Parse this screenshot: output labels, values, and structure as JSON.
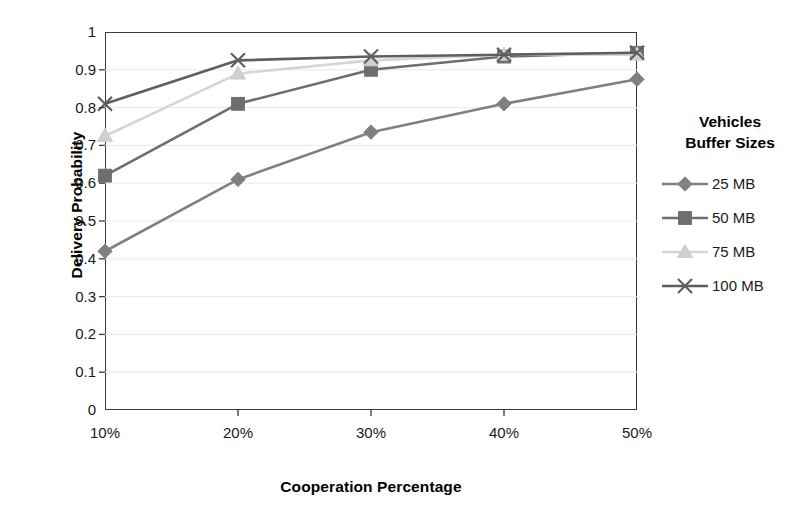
{
  "chart_data": {
    "type": "line",
    "title": "",
    "xlabel": "Cooperation Percentage",
    "ylabel": "Delivery Probability",
    "categories": [
      "10%",
      "20%",
      "30%",
      "40%",
      "50%"
    ],
    "x_tick_labels": [
      "10%",
      "20%",
      "30%",
      "40%",
      "50%"
    ],
    "y_tick_labels": [
      "0",
      "0.1",
      "0.2",
      "0.3",
      "0.4",
      "0.5",
      "0.6",
      "0.7",
      "0.8",
      "0.9",
      "1"
    ],
    "ylim": [
      0,
      1
    ],
    "y_tick_step": 0.1,
    "grid": "horizontal-light",
    "legend_position": "right",
    "legend_title": "Vehicles\nBuffer Sizes",
    "legend_title_line1": "Vehicles",
    "legend_title_line2": "Buffer Sizes",
    "series": [
      {
        "name": "25 MB",
        "marker": "diamond",
        "color": "#808080",
        "line_color": "#808080",
        "values": [
          0.42,
          0.61,
          0.735,
          0.81,
          0.875
        ]
      },
      {
        "name": "50 MB",
        "marker": "square",
        "color": "#6e6e6e",
        "line_color": "#6e6e6e",
        "values": [
          0.62,
          0.81,
          0.9,
          0.935,
          0.945
        ]
      },
      {
        "name": "75 MB",
        "marker": "triangle",
        "color": "#cfcfcf",
        "line_color": "#d5d5d5",
        "values": [
          0.725,
          0.89,
          0.925,
          0.94,
          0.94
        ]
      },
      {
        "name": "100 MB",
        "marker": "x",
        "color": "#5e5e5e",
        "line_color": "#5e5e5e",
        "values": [
          0.81,
          0.925,
          0.935,
          0.94,
          0.945
        ]
      }
    ]
  },
  "colors": {
    "axis": "#3a3a3a",
    "gridline": "#e8e8e8",
    "text": "#1a1a1a",
    "background": "#ffffff"
  },
  "legend": {
    "title_line1": "Vehicles",
    "title_line2": "Buffer Sizes",
    "items": [
      {
        "label": "25 MB"
      },
      {
        "label": "50 MB"
      },
      {
        "label": "75 MB"
      },
      {
        "label": "100 MB"
      }
    ]
  }
}
